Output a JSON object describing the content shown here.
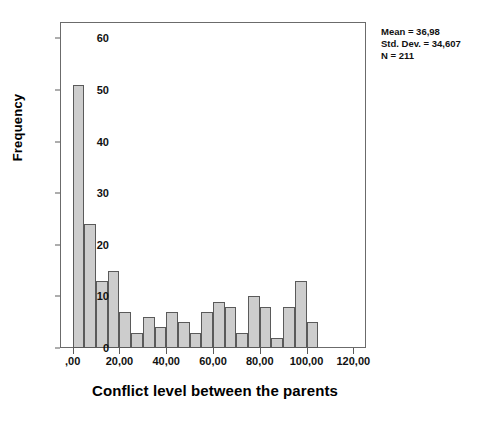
{
  "chart_data": {
    "type": "bar",
    "title": "",
    "subtitle": "",
    "xlabel": "Conflict level between the parents",
    "ylabel": "Frequency",
    "grid": false,
    "legend": "none",
    "bin_width": 5,
    "bin_starts": [
      0,
      5,
      10,
      15,
      20,
      25,
      30,
      35,
      40,
      45,
      50,
      55,
      60,
      65,
      70,
      75,
      80,
      85,
      90,
      95,
      100
    ],
    "categories": [
      "0-5",
      "5-10",
      "10-15",
      "15-20",
      "20-25",
      "25-30",
      "30-35",
      "35-40",
      "40-45",
      "45-50",
      "50-55",
      "55-60",
      "60-65",
      "65-70",
      "70-75",
      "75-80",
      "80-85",
      "85-90",
      "90-95",
      "95-100",
      "100-105"
    ],
    "values": [
      51,
      24,
      13,
      15,
      7,
      3,
      6,
      4,
      7,
      5,
      3,
      7,
      9,
      8,
      3,
      10,
      8,
      2,
      8,
      13,
      5
    ],
    "xlim": [
      -5,
      125
    ],
    "ylim": [
      0,
      63
    ],
    "x_ticks": [
      0,
      20,
      40,
      60,
      80,
      100,
      120
    ],
    "x_tick_labels": [
      ",00",
      "20,00",
      "40,00",
      "60,00",
      "80,00",
      "100,00",
      "120,00"
    ],
    "y_ticks": [
      0,
      10,
      20,
      30,
      40,
      50,
      60
    ],
    "y_tick_labels": [
      "0",
      "10",
      "20",
      "30",
      "40",
      "50",
      "60"
    ],
    "bar_fill_color": "#cdcdcd",
    "bar_edge_color": "#5a5a5a"
  },
  "annotation": {
    "mean_line": "Mean = 36,98",
    "std_dev_line": "Std. Dev. = 34,607",
    "n_line": "N = 211"
  }
}
